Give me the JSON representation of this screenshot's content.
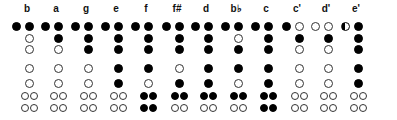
{
  "legend": {
    "F": "closed hole",
    "O": "open hole",
    "H": "half-covered hole"
  },
  "colors": {
    "filled": "#000000",
    "open": "#ffffff",
    "outline": "#333333",
    "background": "#ffffff"
  },
  "hole_order": [
    "thumb",
    "hole1",
    "hole2",
    "hole3",
    "hole4",
    "hole5",
    "hole6_pair",
    "hole7_pair"
  ],
  "notes": [
    {
      "label": "b",
      "thumb": "F",
      "h1": "F",
      "h2": "O",
      "h3": "O",
      "h4": "O",
      "h5": "O",
      "h6": [
        "O",
        "O"
      ],
      "h7": [
        "O",
        "O"
      ]
    },
    {
      "label": "a",
      "thumb": "F",
      "h1": "F",
      "h2": "F",
      "h3": "O",
      "h4": "O",
      "h5": "O",
      "h6": [
        "O",
        "O"
      ],
      "h7": [
        "O",
        "O"
      ]
    },
    {
      "label": "g",
      "thumb": "F",
      "h1": "F",
      "h2": "F",
      "h3": "F",
      "h4": "O",
      "h5": "O",
      "h6": [
        "O",
        "O"
      ],
      "h7": [
        "O",
        "O"
      ]
    },
    {
      "label": "e",
      "thumb": "F",
      "h1": "F",
      "h2": "F",
      "h3": "F",
      "h4": "F",
      "h5": "F",
      "h6": [
        "O",
        "O"
      ],
      "h7": [
        "O",
        "O"
      ]
    },
    {
      "label": "f",
      "thumb": "F",
      "h1": "F",
      "h2": "F",
      "h3": "F",
      "h4": "F",
      "h5": "O",
      "h6": [
        "F",
        "F"
      ],
      "h7": [
        "F",
        "F"
      ]
    },
    {
      "label": "f#",
      "thumb": "F",
      "h1": "F",
      "h2": "F",
      "h3": "F",
      "h4": "O",
      "h5": "F",
      "h6": [
        "F",
        "F"
      ],
      "h7": [
        "O",
        "O"
      ]
    },
    {
      "label": "d",
      "thumb": "F",
      "h1": "F",
      "h2": "F",
      "h3": "F",
      "h4": "F",
      "h5": "F",
      "h6": [
        "F",
        "F"
      ],
      "h7": [
        "O",
        "O"
      ]
    },
    {
      "label": "b♭",
      "thumb": "F",
      "h1": "F",
      "h2": "O",
      "h3": "F",
      "h4": "F",
      "h5": "O",
      "h6": [
        "F",
        "F"
      ],
      "h7": [
        "O",
        "O"
      ]
    },
    {
      "label": "c",
      "thumb": "F",
      "h1": "F",
      "h2": "F",
      "h3": "F",
      "h4": "F",
      "h5": "F",
      "h6": [
        "F",
        "F"
      ],
      "h7": [
        "F",
        "F"
      ]
    },
    {
      "label": "c'",
      "thumb": "F",
      "h1": "O",
      "h2": "F",
      "h3": "O",
      "h4": "O",
      "h5": "O",
      "h6": [
        "O",
        "O"
      ],
      "h7": [
        "O",
        "O"
      ]
    },
    {
      "label": "d'",
      "thumb": "O",
      "h1": "O",
      "h2": "F",
      "h3": "O",
      "h4": "O",
      "h5": "O",
      "h6": [
        "O",
        "O"
      ],
      "h7": [
        "O",
        "O"
      ]
    },
    {
      "label": "e'",
      "thumb": "H",
      "h1": "F",
      "h2": "F",
      "h3": "F",
      "h4": "F",
      "h5": "F",
      "h6": [
        "O",
        "O"
      ],
      "h7": [
        "O",
        "O"
      ]
    }
  ]
}
